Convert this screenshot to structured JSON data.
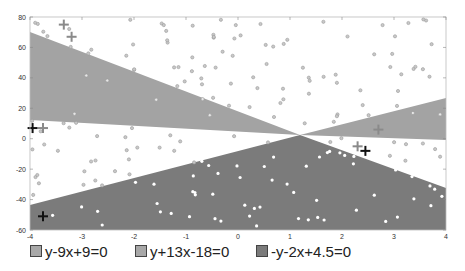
{
  "chart_data": {
    "type": "scatter",
    "title": "",
    "xlabel": "",
    "ylabel": "",
    "xlim": [
      -4,
      4
    ],
    "ylim": [
      -60,
      80
    ],
    "xticks": [
      -4,
      -3,
      -2,
      -1,
      0,
      1,
      2,
      3,
      4
    ],
    "yticks": [
      -60,
      -40,
      -20,
      0,
      20,
      40,
      60,
      80
    ],
    "grid": false,
    "legend_position": "bottom",
    "regions": [
      {
        "name": "y-9x+9=0",
        "color": "#a3a3a3",
        "description": "upper-left and right wedges"
      },
      {
        "name": "y+13x-18=0",
        "color": "#a3a3a3",
        "description": "light wedge region"
      },
      {
        "name": "-y-2x+4.5=0",
        "color": "#7b7b7b",
        "description": "bottom triangular region"
      }
    ],
    "markers": {
      "plus_black": [
        [
          -3.95,
          7
        ],
        [
          -3.75,
          -51
        ],
        [
          2.45,
          -8
        ]
      ],
      "plus_gray": [
        [
          -3.75,
          7
        ],
        [
          -3.35,
          75
        ],
        [
          -3.2,
          67
        ],
        [
          2.3,
          -5
        ],
        [
          2.7,
          6
        ]
      ]
    }
  },
  "legend": {
    "items": [
      {
        "label": "y-9x+9=0",
        "color": "#a8a8a8"
      },
      {
        "label": "y+13x-18=0",
        "color": "#a8a8a8"
      },
      {
        "label": "-y-2x+4.5=0",
        "color": "#7b7b7b"
      }
    ]
  }
}
